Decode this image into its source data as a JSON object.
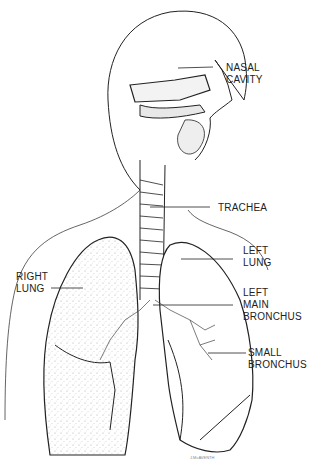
{
  "diagram": {
    "labels": [
      {
        "id": "nasal-cavity",
        "lines": [
          "NASAL",
          "CAVITY"
        ]
      },
      {
        "id": "trachea",
        "lines": [
          "TRACHEA"
        ]
      },
      {
        "id": "left-lung",
        "lines": [
          "LEFT",
          "LUNG"
        ]
      },
      {
        "id": "right-lung",
        "lines": [
          "RIGHT",
          "LUNG"
        ]
      },
      {
        "id": "left-main-bronchus",
        "lines": [
          "LEFT",
          "MAIN",
          "BRONCHUS"
        ]
      },
      {
        "id": "small-bronchus",
        "lines": [
          "SMALL",
          "BRONCHUS"
        ]
      }
    ],
    "signature": "J.McAVENTH"
  },
  "colors": {
    "line": "#222222",
    "stipple": "#9a9a9a",
    "background": "#ffffff"
  }
}
